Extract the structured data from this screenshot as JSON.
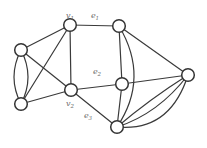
{
  "figure": {
    "background_color": "#ffffff",
    "edge_color": "#3a3a3a",
    "node_fill_color": "#ffffff",
    "node_stroke_color": "#333333",
    "label_color": "#6e6e6e",
    "node_radius": 6.3,
    "nodes": [
      {
        "id": "v1",
        "name": "node-v1",
        "x": 70,
        "y": 25
      },
      {
        "id": "tr",
        "name": "node-top-right",
        "x": 119,
        "y": 26
      },
      {
        "id": "lu",
        "name": "node-left-upper",
        "x": 21,
        "y": 50
      },
      {
        "id": "ll",
        "name": "node-left-lower",
        "x": 21,
        "y": 104
      },
      {
        "id": "v2",
        "name": "node-v2",
        "x": 71,
        "y": 90
      },
      {
        "id": "mr",
        "name": "node-mid-right",
        "x": 122,
        "y": 84
      },
      {
        "id": "r",
        "name": "node-right",
        "x": 188,
        "y": 75
      },
      {
        "id": "b",
        "name": "node-bottom",
        "x": 117,
        "y": 127
      }
    ],
    "edges": [
      {
        "id": "e1",
        "from": "v1",
        "to": "tr"
      },
      {
        "id": "v1-left-upper",
        "from": "v1",
        "to": "lu"
      },
      {
        "id": "v1-left-lower",
        "from": "v1",
        "to": "ll"
      },
      {
        "id": "v1-v2",
        "from": "v1",
        "to": "v2"
      },
      {
        "id": "left-pair-arc-west",
        "from": "lu",
        "to": "ll",
        "ctrl": [
          7,
          77
        ]
      },
      {
        "id": "left-pair-arc-east",
        "from": "lu",
        "to": "ll",
        "ctrl": [
          35,
          77
        ]
      },
      {
        "id": "left-upper-v2",
        "from": "lu",
        "to": "v2"
      },
      {
        "id": "left-lower-v2",
        "from": "ll",
        "to": "v2"
      },
      {
        "id": "e2",
        "from": "v2",
        "to": "mr"
      },
      {
        "id": "e3",
        "from": "v2",
        "to": "b"
      },
      {
        "id": "top-right-mid-right",
        "from": "tr",
        "to": "mr"
      },
      {
        "id": "top-right-right",
        "from": "tr",
        "to": "r"
      },
      {
        "id": "top-right-bottom-curve",
        "from": "tr",
        "to": "b",
        "ctrl": [
          150,
          78
        ]
      },
      {
        "id": "mid-right-right",
        "from": "mr",
        "to": "r"
      },
      {
        "id": "mid-right-bottom",
        "from": "mr",
        "to": "b"
      },
      {
        "id": "bottom-right-arc-1",
        "from": "b",
        "to": "r",
        "ctrl": [
          150,
          99
        ]
      },
      {
        "id": "bottom-right-arc-2",
        "from": "b",
        "to": "r",
        "ctrl": [
          158,
          114
        ]
      },
      {
        "id": "bottom-right-arc-3",
        "from": "b",
        "to": "r",
        "ctrl": [
          170,
          132
        ]
      }
    ],
    "labels": [
      {
        "name": "label-v1",
        "base": "v",
        "sub": "1",
        "x": 70,
        "y": 18
      },
      {
        "name": "label-e1",
        "base": "e",
        "sub": "1",
        "x": 95,
        "y": 18
      },
      {
        "name": "label-e2",
        "base": "e",
        "sub": "2",
        "x": 97,
        "y": 74
      },
      {
        "name": "label-v2",
        "base": "v",
        "sub": "2",
        "x": 70,
        "y": 106
      },
      {
        "name": "label-e3",
        "base": "e",
        "sub": "3",
        "x": 88,
        "y": 118
      }
    ]
  }
}
